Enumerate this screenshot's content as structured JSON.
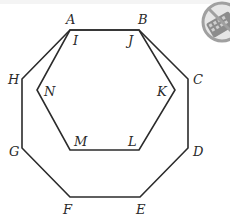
{
  "diagram": {
    "colors": {
      "line": "#2b2b2b",
      "label": "#2a2a2a",
      "icon": "#9a9a9a",
      "background": "#ffffff"
    },
    "octagon": {
      "vertices": [
        {
          "label": "A",
          "x": 70,
          "y": 30,
          "lx": 66,
          "ly": 24
        },
        {
          "label": "B",
          "x": 139,
          "y": 30,
          "lx": 138,
          "ly": 24
        },
        {
          "label": "C",
          "x": 188,
          "y": 79,
          "lx": 193,
          "ly": 84
        },
        {
          "label": "D",
          "x": 188,
          "y": 148,
          "lx": 193,
          "ly": 156
        },
        {
          "label": "E",
          "x": 140,
          "y": 197,
          "lx": 136,
          "ly": 214
        },
        {
          "label": "F",
          "x": 70,
          "y": 197,
          "lx": 63,
          "ly": 214
        },
        {
          "label": "G",
          "x": 22,
          "y": 148,
          "lx": 9,
          "ly": 156
        },
        {
          "label": "H",
          "x": 22,
          "y": 79,
          "lx": 8,
          "ly": 84
        }
      ]
    },
    "hexagon": {
      "vertices": [
        {
          "label": "I",
          "x": 70,
          "y": 30,
          "lx": 73,
          "ly": 45
        },
        {
          "label": "J",
          "x": 139,
          "y": 30,
          "lx": 128,
          "ly": 45
        },
        {
          "label": "K",
          "x": 175,
          "y": 90,
          "lx": 157,
          "ly": 96
        },
        {
          "label": "L",
          "x": 139,
          "y": 150,
          "lx": 128,
          "ly": 146
        },
        {
          "label": "M",
          "x": 70,
          "y": 150,
          "lx": 74,
          "ly": 146
        },
        {
          "label": "N",
          "x": 37,
          "y": 90,
          "lx": 44,
          "ly": 96
        }
      ]
    },
    "icon": {
      "name": "no-calculator-icon",
      "meaning": "calculator not allowed"
    }
  }
}
